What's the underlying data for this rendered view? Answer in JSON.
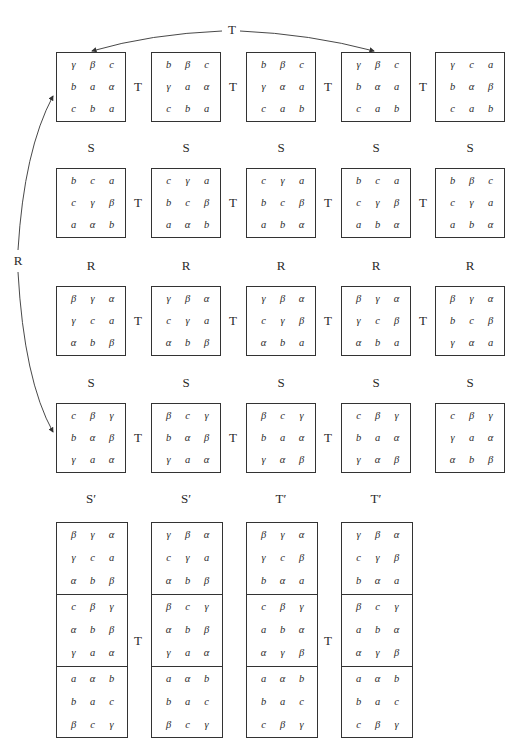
{
  "arrows": {
    "top_label": "T",
    "left_label": "R"
  },
  "rows": [
    {
      "matrices": [
        [
          [
            "γ",
            "β",
            "c"
          ],
          [
            "b",
            "a",
            "α"
          ],
          [
            "c",
            "b",
            "a"
          ]
        ],
        [
          [
            "b",
            "β",
            "c"
          ],
          [
            "γ",
            "a",
            "α"
          ],
          [
            "c",
            "b",
            "a"
          ]
        ],
        [
          [
            "b",
            "β",
            "c"
          ],
          [
            "γ",
            "α",
            "a"
          ],
          [
            "c",
            "a",
            "b"
          ]
        ],
        [
          [
            "γ",
            "β",
            "c"
          ],
          [
            "b",
            "α",
            "a"
          ],
          [
            "c",
            "a",
            "b"
          ]
        ],
        [
          [
            "γ",
            "c",
            "a"
          ],
          [
            "b",
            "α",
            "β"
          ],
          [
            "c",
            "a",
            "b"
          ]
        ]
      ],
      "ops": [
        "T",
        "T",
        "T",
        "T"
      ],
      "below": [
        "S",
        "S",
        "S",
        "S",
        "S"
      ]
    },
    {
      "matrices": [
        [
          [
            "b",
            "c",
            "a"
          ],
          [
            "c",
            "γ",
            "β"
          ],
          [
            "a",
            "α",
            "b"
          ]
        ],
        [
          [
            "c",
            "γ",
            "a"
          ],
          [
            "b",
            "c",
            "β"
          ],
          [
            "a",
            "α",
            "b"
          ]
        ],
        [
          [
            "c",
            "γ",
            "a"
          ],
          [
            "b",
            "c",
            "β"
          ],
          [
            "a",
            "b",
            "α"
          ]
        ],
        [
          [
            "b",
            "c",
            "a"
          ],
          [
            "c",
            "γ",
            "β"
          ],
          [
            "a",
            "b",
            "α"
          ]
        ],
        [
          [
            "b",
            "β",
            "c"
          ],
          [
            "c",
            "γ",
            "a"
          ],
          [
            "a",
            "b",
            "α"
          ]
        ]
      ],
      "ops": [
        "T",
        "T",
        "T",
        "T"
      ],
      "below": [
        "R",
        "R",
        "R",
        "R",
        "R"
      ]
    },
    {
      "matrices": [
        [
          [
            "β",
            "γ",
            "α"
          ],
          [
            "γ",
            "c",
            "a"
          ],
          [
            "α",
            "b",
            "β"
          ]
        ],
        [
          [
            "γ",
            "β",
            "α"
          ],
          [
            "c",
            "γ",
            "a"
          ],
          [
            "α",
            "b",
            "β"
          ]
        ],
        [
          [
            "γ",
            "β",
            "α"
          ],
          [
            "c",
            "γ",
            "β"
          ],
          [
            "α",
            "b",
            "a"
          ]
        ],
        [
          [
            "β",
            "γ",
            "α"
          ],
          [
            "γ",
            "c",
            "β"
          ],
          [
            "α",
            "b",
            "a"
          ]
        ],
        [
          [
            "β",
            "γ",
            "α"
          ],
          [
            "b",
            "c",
            "β"
          ],
          [
            "γ",
            "α",
            "a"
          ]
        ]
      ],
      "ops": [
        "T",
        "T",
        "T",
        "T"
      ],
      "below": [
        "S",
        "S",
        "S",
        "S",
        "S"
      ]
    },
    {
      "matrices": [
        [
          [
            "c",
            "β",
            "γ"
          ],
          [
            "b",
            "α",
            "β"
          ],
          [
            "γ",
            "a",
            "α"
          ]
        ],
        [
          [
            "β",
            "c",
            "γ"
          ],
          [
            "b",
            "α",
            "β"
          ],
          [
            "γ",
            "a",
            "α"
          ]
        ],
        [
          [
            "β",
            "c",
            "γ"
          ],
          [
            "b",
            "a",
            "α"
          ],
          [
            "γ",
            "α",
            "β"
          ]
        ],
        [
          [
            "c",
            "β",
            "γ"
          ],
          [
            "b",
            "a",
            "α"
          ],
          [
            "γ",
            "α",
            "β"
          ]
        ],
        [
          [
            "c",
            "β",
            "γ"
          ],
          [
            "γ",
            "a",
            "α"
          ],
          [
            "α",
            "b",
            "β"
          ]
        ]
      ],
      "ops": [
        "T",
        "T",
        "T"
      ],
      "below": [
        "S′",
        "S′",
        "T′",
        "T′"
      ]
    }
  ],
  "tall_blocks": {
    "matrices": [
      [
        [
          [
            "β",
            "γ",
            "α"
          ],
          [
            "γ",
            "c",
            "a"
          ],
          [
            "α",
            "b",
            "β"
          ]
        ],
        [
          [
            "c",
            "β",
            "γ"
          ],
          [
            "α",
            "b",
            "β"
          ],
          [
            "γ",
            "a",
            "α"
          ]
        ],
        [
          [
            "a",
            "α",
            "b"
          ],
          [
            "b",
            "a",
            "c"
          ],
          [
            "β",
            "c",
            "γ"
          ]
        ]
      ],
      [
        [
          [
            "γ",
            "β",
            "α"
          ],
          [
            "c",
            "γ",
            "a"
          ],
          [
            "α",
            "b",
            "β"
          ]
        ],
        [
          [
            "β",
            "c",
            "γ"
          ],
          [
            "α",
            "b",
            "β"
          ],
          [
            "γ",
            "a",
            "α"
          ]
        ],
        [
          [
            "a",
            "α",
            "b"
          ],
          [
            "b",
            "a",
            "c"
          ],
          [
            "β",
            "c",
            "γ"
          ]
        ]
      ],
      [
        [
          [
            "β",
            "γ",
            "α"
          ],
          [
            "γ",
            "c",
            "β"
          ],
          [
            "b",
            "α",
            "a"
          ]
        ],
        [
          [
            "c",
            "β",
            "γ"
          ],
          [
            "a",
            "b",
            "α"
          ],
          [
            "α",
            "γ",
            "β"
          ]
        ],
        [
          [
            "a",
            "α",
            "b"
          ],
          [
            "b",
            "a",
            "c"
          ],
          [
            "c",
            "β",
            "γ"
          ]
        ]
      ],
      [
        [
          [
            "γ",
            "β",
            "α"
          ],
          [
            "c",
            "γ",
            "β"
          ],
          [
            "b",
            "α",
            "a"
          ]
        ],
        [
          [
            "β",
            "c",
            "γ"
          ],
          [
            "a",
            "b",
            "α"
          ],
          [
            "α",
            "γ",
            "β"
          ]
        ],
        [
          [
            "a",
            "α",
            "b"
          ],
          [
            "b",
            "a",
            "c"
          ],
          [
            "c",
            "β",
            "γ"
          ]
        ]
      ]
    ],
    "ops": [
      "T",
      "T"
    ]
  }
}
